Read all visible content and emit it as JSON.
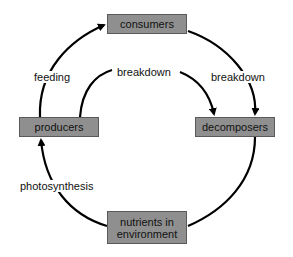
{
  "diagram": {
    "type": "cycle",
    "nodes": {
      "consumers": "consumers",
      "producers": "producers",
      "decomposers": "decomposers",
      "nutrients_line1": "nutrients in",
      "nutrients_line2": "environment"
    },
    "edges": [
      {
        "from": "producers",
        "to": "consumers",
        "label": "feeding"
      },
      {
        "from": "producers",
        "to": "decomposers",
        "label": "breakdown"
      },
      {
        "from": "consumers",
        "to": "decomposers",
        "label": "breakdown"
      },
      {
        "from": "decomposers",
        "to": "nutrients in environment",
        "label": ""
      },
      {
        "from": "nutrients in environment",
        "to": "producers",
        "label": "photosynthesis"
      }
    ],
    "labels": {
      "feeding": "feeding",
      "breakdown_inner": "breakdown",
      "breakdown_outer": "breakdown",
      "photosynthesis": "photosynthesis"
    },
    "colors": {
      "node_fill": "#8f8f8f",
      "node_border": "#5a5a5a",
      "arrow": "#000000",
      "background": "#ffffff"
    }
  }
}
